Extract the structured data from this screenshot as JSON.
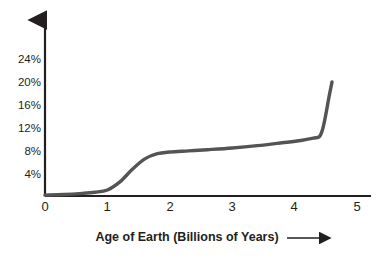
{
  "chart_data": {
    "type": "line",
    "title": "",
    "xlabel": "Age of Earth (Billions of Years)",
    "ylabel": "",
    "xlim": [
      0,
      5.35
    ],
    "ylim": [
      0,
      26
    ],
    "grid": false,
    "legend": "none",
    "x_ticks": [
      "0",
      "1",
      "2",
      "3",
      "4",
      "5"
    ],
    "x_tick_values": [
      0,
      1,
      2,
      3,
      4,
      5
    ],
    "y_ticks": [
      "4%",
      "8%",
      "12%",
      "16%",
      "20%",
      "24%"
    ],
    "y_tick_values": [
      4,
      8,
      12,
      16,
      20,
      24
    ],
    "series": [
      {
        "name": "Atmospheric Oxygen",
        "color": "#545454",
        "x": [
          0.0,
          0.3,
          0.6,
          0.8,
          1.0,
          1.2,
          1.4,
          1.6,
          1.8,
          2.0,
          2.3,
          2.6,
          3.0,
          3.4,
          3.8,
          4.1,
          4.3,
          4.4,
          4.45,
          4.5,
          4.55,
          4.6
        ],
        "values": [
          0.5,
          0.6,
          0.8,
          1.0,
          1.4,
          2.8,
          5.0,
          6.8,
          7.7,
          8.0,
          8.2,
          8.4,
          8.7,
          9.1,
          9.6,
          10.0,
          10.4,
          10.7,
          12.0,
          14.5,
          17.5,
          20.2
        ]
      }
    ]
  },
  "axis": {
    "y_arrow": "up-arrow",
    "caption_arrow": "right-arrow"
  }
}
